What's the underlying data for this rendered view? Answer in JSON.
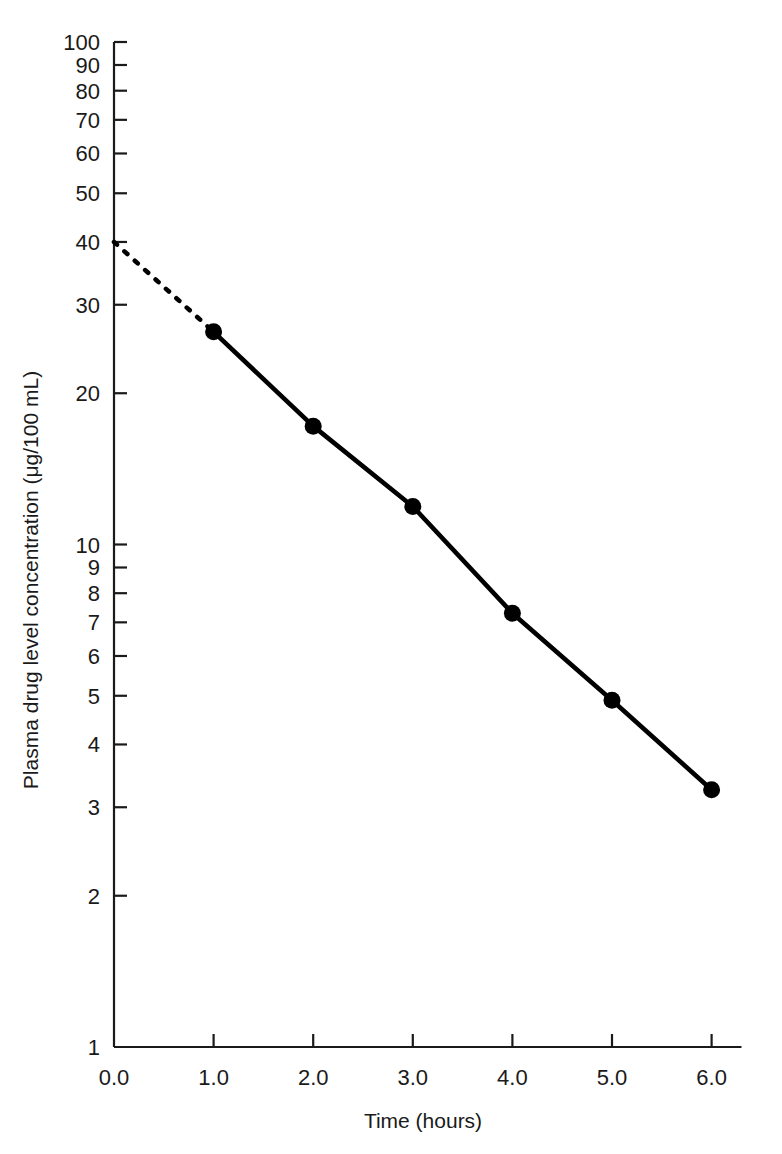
{
  "chart_data": {
    "type": "line",
    "title": "",
    "xlabel": "Time (hours)",
    "ylabel": "Plasma drug level concentration (μg/100 mL)",
    "yscale": "log",
    "xscale": "linear",
    "xlim": [
      0.0,
      6.3
    ],
    "ylim": [
      1,
      100
    ],
    "grid": false,
    "legend": null,
    "x_tick_labels": [
      "0.0",
      "1.0",
      "2.0",
      "3.0",
      "4.0",
      "5.0",
      "6.0"
    ],
    "x_ticks": [
      0.0,
      1.0,
      2.0,
      3.0,
      4.0,
      5.0,
      6.0
    ],
    "y_tick_labels": [
      "100",
      "90",
      "80",
      "70",
      "60",
      "50",
      "40",
      "30",
      "20",
      "10",
      "9",
      "8",
      "7",
      "6",
      "5",
      "4",
      "3",
      "2",
      "1"
    ],
    "y_ticks": [
      100,
      90,
      80,
      70,
      60,
      50,
      40,
      30,
      20,
      10,
      9,
      8,
      7,
      6,
      5,
      4,
      3,
      2,
      1
    ],
    "series": [
      {
        "name": "measured-plasma-concentration",
        "style": "solid-with-markers",
        "x": [
          1.0,
          2.0,
          3.0,
          4.0,
          5.0,
          6.0
        ],
        "values": [
          26.5,
          17.2,
          11.9,
          7.3,
          4.9,
          3.25
        ]
      },
      {
        "name": "extrapolated-to-zero-time",
        "style": "dotted",
        "x": [
          0.0,
          1.0
        ],
        "values": [
          40.0,
          26.5
        ]
      }
    ],
    "annotations": {
      "extrapolated_intercept": 40.0,
      "intercept_label": ""
    },
    "colors": {
      "line": "#000000",
      "marker": "#000000",
      "axis": "#1a1a1a",
      "background": "#ffffff"
    }
  }
}
